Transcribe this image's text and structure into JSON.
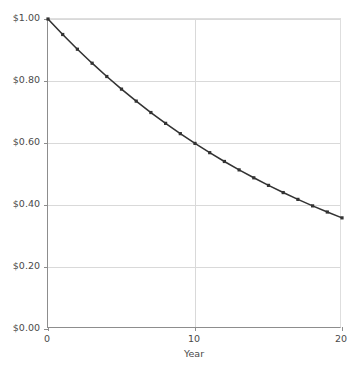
{
  "chart_data": {
    "type": "line",
    "title": "",
    "xlabel": "Year",
    "ylabel": "",
    "xlim": [
      0,
      20
    ],
    "ylim": [
      0,
      1.0
    ],
    "grid": true,
    "legend": false,
    "marker": "square",
    "line_color": "#333333",
    "marker_color": "#333333",
    "grid_color": "#d9d9d9",
    "axis_color": "#8d8d8d",
    "x_ticks": [
      0,
      10,
      20
    ],
    "x_tick_labels": [
      "0",
      "10",
      "20"
    ],
    "y_ticks": [
      0.0,
      0.2,
      0.4,
      0.6,
      0.8,
      1.0
    ],
    "y_tick_labels": [
      "$0.00",
      "$0.20",
      "$0.40",
      "$0.60",
      "$0.80",
      "$1.00"
    ],
    "x": [
      0,
      1,
      2,
      3,
      4,
      5,
      6,
      7,
      8,
      9,
      10,
      11,
      12,
      13,
      14,
      15,
      16,
      17,
      18,
      19,
      20
    ],
    "values": [
      1.0,
      0.95,
      0.9025,
      0.8574,
      0.8145,
      0.7738,
      0.7351,
      0.6983,
      0.6634,
      0.6302,
      0.5987,
      0.5688,
      0.5404,
      0.5133,
      0.4877,
      0.4633,
      0.4401,
      0.4181,
      0.3972,
      0.3774,
      0.3585
    ]
  },
  "axis_titles": {
    "x": "Year"
  }
}
